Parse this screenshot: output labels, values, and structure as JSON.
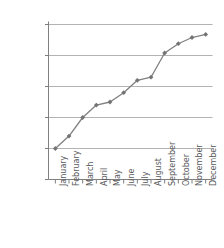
{
  "chart_data": {
    "type": "line",
    "title": "",
    "subtitle": "",
    "xlabel": "",
    "ylabel": "",
    "categories": [
      "January",
      "February",
      "March",
      "April",
      "May",
      "June",
      "July",
      "August",
      "September",
      "October",
      "November",
      "December"
    ],
    "values": [
      1500,
      1520,
      1550,
      1570,
      1575,
      1590,
      1610,
      1615,
      1654,
      1669,
      1679,
      1684
    ],
    "series": [
      {
        "name": "",
        "values": [
          1500,
          1520,
          1550,
          1570,
          1575,
          1590,
          1610,
          1615,
          1654,
          1669,
          1679,
          1684
        ]
      }
    ],
    "ylim": [
      1450,
      1700
    ],
    "ytick_values": [
      1450,
      1500,
      1550,
      1600,
      1650,
      1700
    ],
    "ytick_labels": [
      "$1,450",
      "$1,500",
      "$1,550",
      "$1,600",
      "$1,650",
      "$1,700"
    ],
    "xtick_labels": [
      "January",
      "February",
      "March",
      "April",
      "May",
      "June",
      "July",
      "August",
      "September",
      "October",
      "November",
      "December"
    ],
    "grid": true,
    "grid_axis": "y",
    "legend": false,
    "legend_position": "none",
    "marker": "diamond",
    "line_color": "#808080",
    "marker_color": "#737373",
    "grid_color": "#b3b3b3",
    "axis_color": "#808080",
    "text_color": "#58595b",
    "background_color": "#ffffff",
    "annotations": []
  }
}
